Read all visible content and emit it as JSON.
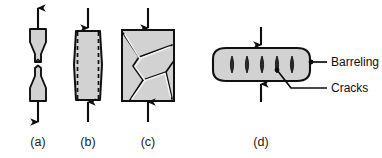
{
  "figure": {
    "colors": {
      "specimen_fill": "#d2d2d2",
      "specimen_fill_light": "#dcdcdc",
      "outline": "#101010",
      "crack_fill": "#2b2b2b",
      "background": "#ffffff",
      "text": "#1a1a1a"
    },
    "captions": [
      {
        "id": "a",
        "label": "(a)"
      },
      {
        "id": "b",
        "label": "(b)"
      },
      {
        "id": "c",
        "label": "(c)"
      },
      {
        "id": "d",
        "label": "(d)"
      }
    ],
    "annotations": [
      {
        "id": "barreling",
        "label": "Barreling"
      },
      {
        "id": "cracks",
        "label": "Cracks"
      }
    ],
    "specimens": [
      {
        "id": "a",
        "name": "tensile-necked-fracture",
        "load": "tension",
        "arrow_top": "up",
        "arrow_bottom": "down",
        "feature": "cup-and-cone fracture with necking"
      },
      {
        "id": "b",
        "name": "compression-barreling",
        "load": "compression",
        "arrow_top": "down",
        "arrow_bottom": "up",
        "feature": "barreling with original outline dashed"
      },
      {
        "id": "c",
        "name": "compression-shear-cracking",
        "load": "compression",
        "arrow_top": "down",
        "arrow_bottom": "up",
        "feature": "internal shear crack network"
      },
      {
        "id": "d",
        "name": "upset-barreling-cracks",
        "load": "compression",
        "arrow_top": "down",
        "arrow_bottom": "up",
        "feature": "barrelled billet with surface cracks",
        "crack_count": 5
      }
    ]
  }
}
